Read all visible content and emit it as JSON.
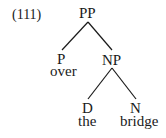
{
  "example_number": "(111)",
  "tree": {
    "root": {
      "label": "PP"
    },
    "p": {
      "label": "P",
      "word": "over"
    },
    "np": {
      "label": "NP"
    },
    "d": {
      "label": "D",
      "word": "the"
    },
    "n": {
      "label": "N",
      "word": "bridge"
    }
  },
  "colors": {
    "ink": "#1a1a1a",
    "background": "#ffffff"
  }
}
